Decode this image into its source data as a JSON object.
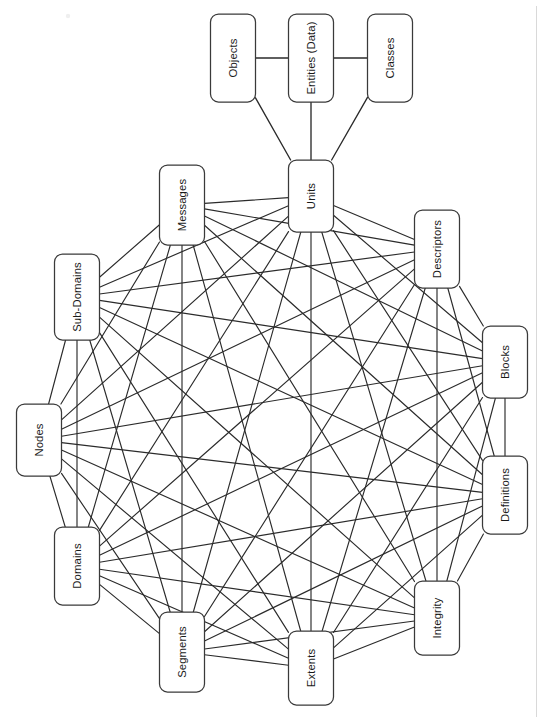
{
  "diagram": {
    "type": "node-link-network",
    "style": {
      "node_fill": "#ffffff",
      "node_stroke": "#3a3a3a",
      "edge_color": "#2b2b2b",
      "background": "#ffffff",
      "text_color": "#1a1a1a",
      "text_orientation": "rotated-90-ccw"
    },
    "hierarchy": {
      "root_label": "Entities (Data)",
      "siblings": [
        "Objects",
        "Classes"
      ],
      "child": "Units"
    },
    "nodes": [
      {
        "id": "objects",
        "label": "Objects",
        "group": "hierarchy",
        "x": 233,
        "y": 58,
        "w": 45,
        "h": 88
      },
      {
        "id": "entities",
        "label": "Entities (Data)",
        "group": "hierarchy",
        "x": 311,
        "y": 58,
        "w": 45,
        "h": 88
      },
      {
        "id": "classes",
        "label": "Classes",
        "group": "hierarchy",
        "x": 390,
        "y": 58,
        "w": 45,
        "h": 88
      },
      {
        "id": "units",
        "label": "Units",
        "group": "ring",
        "x": 311,
        "y": 196,
        "w": 45,
        "h": 72
      },
      {
        "id": "descriptors",
        "label": "Descriptors",
        "group": "ring",
        "x": 437,
        "y": 249,
        "w": 45,
        "h": 78
      },
      {
        "id": "blocks",
        "label": "Blocks",
        "group": "ring",
        "x": 505,
        "y": 362,
        "w": 45,
        "h": 72
      },
      {
        "id": "definitions",
        "label": "Definitions",
        "group": "ring",
        "x": 505,
        "y": 495,
        "w": 45,
        "h": 78
      },
      {
        "id": "integrity",
        "label": "Integrity",
        "group": "ring",
        "x": 437,
        "y": 618,
        "w": 45,
        "h": 74
      },
      {
        "id": "extents",
        "label": "Extents",
        "group": "ring",
        "x": 311,
        "y": 668,
        "w": 45,
        "h": 74
      },
      {
        "id": "segments",
        "label": "Segments",
        "group": "ring",
        "x": 182,
        "y": 652,
        "w": 45,
        "h": 80
      },
      {
        "id": "domains",
        "label": "Domains",
        "group": "ring",
        "x": 77,
        "y": 566,
        "w": 45,
        "h": 78
      },
      {
        "id": "nodes",
        "label": "Nodes",
        "group": "ring",
        "x": 39,
        "y": 440,
        "w": 45,
        "h": 72
      },
      {
        "id": "subdomains",
        "label": "Sub-Domains",
        "group": "ring",
        "x": 77,
        "y": 297,
        "w": 45,
        "h": 86
      },
      {
        "id": "messages",
        "label": "Messages",
        "group": "ring",
        "x": 182,
        "y": 205,
        "w": 45,
        "h": 80
      }
    ],
    "hierarchy_edges": [
      {
        "from": "objects",
        "to": "entities"
      },
      {
        "from": "entities",
        "to": "classes"
      },
      {
        "from": "entities",
        "to": "units"
      },
      {
        "from": "objects",
        "to": "units"
      },
      {
        "from": "classes",
        "to": "units"
      }
    ],
    "ring_members": [
      "units",
      "descriptors",
      "blocks",
      "definitions",
      "integrity",
      "extents",
      "segments",
      "domains",
      "nodes",
      "subdomains",
      "messages"
    ],
    "ring_connectivity": "complete-graph",
    "ring_edge_count": 55,
    "node_count": 14,
    "total_edge_count": 60
  }
}
